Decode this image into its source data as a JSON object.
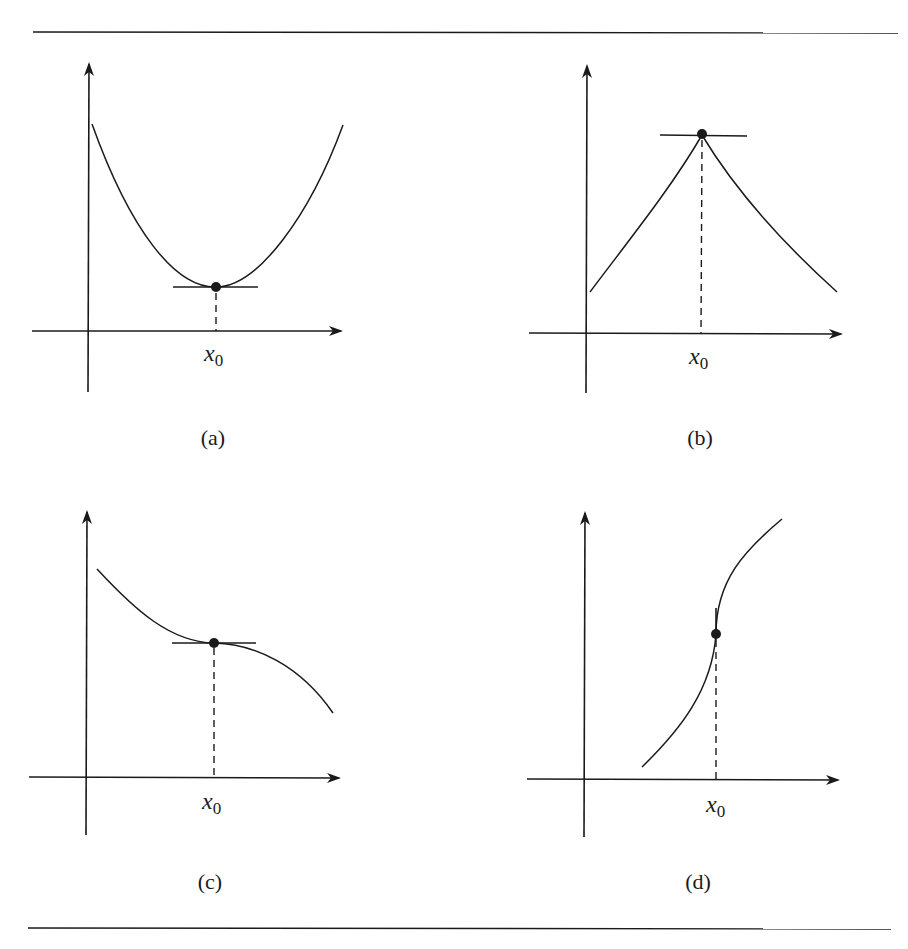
{
  "figure": {
    "panels": [
      {
        "id": "a",
        "caption": "(a)",
        "point_label_var": "x",
        "point_label_sub": "0",
        "description": "local minimum with horizontal tangent"
      },
      {
        "id": "b",
        "caption": "(b)",
        "point_label_var": "x",
        "point_label_sub": "0",
        "description": "local maximum at a corner (cusp), horizontal line through peak"
      },
      {
        "id": "c",
        "caption": "(c)",
        "point_label_var": "x",
        "point_label_sub": "0",
        "description": "decreasing function with horizontal tangent (inflection point)"
      },
      {
        "id": "d",
        "caption": "(d)",
        "point_label_var": "x",
        "point_label_sub": "0",
        "description": "increasing function with vertical tangent at x0"
      }
    ],
    "colors": {
      "ink": "#1a1a1a",
      "background": "#ffffff"
    }
  }
}
